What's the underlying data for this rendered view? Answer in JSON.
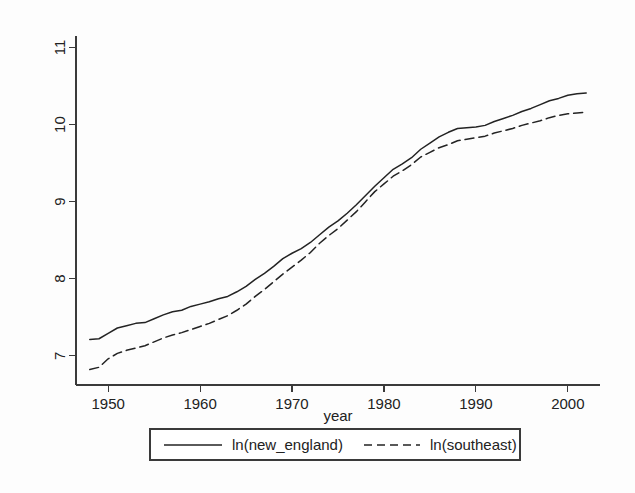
{
  "chart_data": {
    "type": "line",
    "title": "",
    "subtitle": "",
    "xlabel": "year",
    "ylabel": "",
    "xlim": [
      1946.5,
      2003.5
    ],
    "ylim": [
      6.62,
      11.15
    ],
    "grid": false,
    "legend_position": "bottom-outside",
    "xticks": [
      "1950",
      "1960",
      "1970",
      "1980",
      "1990",
      "2000"
    ],
    "xtick_values": [
      1950,
      1960,
      1970,
      1980,
      1990,
      2000
    ],
    "yticks": [
      "7",
      "8",
      "9",
      "10",
      "11"
    ],
    "ytick_values": [
      7,
      8,
      9,
      10,
      11
    ],
    "x": [
      1948,
      1949,
      1950,
      1951,
      1952,
      1953,
      1954,
      1955,
      1956,
      1957,
      1958,
      1959,
      1960,
      1961,
      1962,
      1963,
      1964,
      1965,
      1966,
      1967,
      1968,
      1969,
      1970,
      1971,
      1972,
      1973,
      1974,
      1975,
      1976,
      1977,
      1978,
      1979,
      1980,
      1981,
      1982,
      1983,
      1984,
      1985,
      1986,
      1987,
      1988,
      1989,
      1990,
      1991,
      1992,
      1993,
      1994,
      1995,
      1996,
      1997,
      1998,
      1999,
      2000,
      2001,
      2002
    ],
    "series": [
      {
        "name": "ln(new_england)",
        "style": "solid",
        "color": "#232323",
        "values": [
          7.21,
          7.22,
          7.29,
          7.36,
          7.39,
          7.42,
          7.43,
          7.48,
          7.53,
          7.57,
          7.59,
          7.64,
          7.67,
          7.7,
          7.74,
          7.77,
          7.83,
          7.9,
          7.99,
          8.07,
          8.16,
          8.26,
          8.33,
          8.39,
          8.47,
          8.57,
          8.67,
          8.75,
          8.85,
          8.96,
          9.08,
          9.2,
          9.31,
          9.42,
          9.49,
          9.57,
          9.68,
          9.76,
          9.84,
          9.9,
          9.95,
          9.96,
          9.97,
          9.99,
          10.04,
          10.08,
          10.12,
          10.17,
          10.21,
          10.26,
          10.31,
          10.34,
          10.38,
          10.4,
          10.41
        ]
      },
      {
        "name": "ln(southeast)",
        "style": "dashed",
        "color": "#232323",
        "values": [
          6.82,
          6.85,
          6.96,
          7.03,
          7.07,
          7.1,
          7.13,
          7.18,
          7.23,
          7.27,
          7.3,
          7.34,
          7.38,
          7.42,
          7.47,
          7.52,
          7.59,
          7.67,
          7.77,
          7.86,
          7.96,
          8.06,
          8.15,
          8.24,
          8.34,
          8.46,
          8.56,
          8.65,
          8.76,
          8.87,
          9.0,
          9.13,
          9.23,
          9.33,
          9.4,
          9.48,
          9.58,
          9.64,
          9.7,
          9.74,
          9.79,
          9.81,
          9.83,
          9.85,
          9.89,
          9.92,
          9.95,
          9.99,
          10.02,
          10.05,
          10.09,
          10.12,
          10.14,
          10.15,
          10.16
        ]
      }
    ]
  },
  "axis": {
    "x_title": "year"
  },
  "legend": {
    "entries": [
      {
        "label": "ln(new_england)",
        "style": "solid"
      },
      {
        "label": "ln(southeast)",
        "style": "dashed"
      }
    ]
  }
}
